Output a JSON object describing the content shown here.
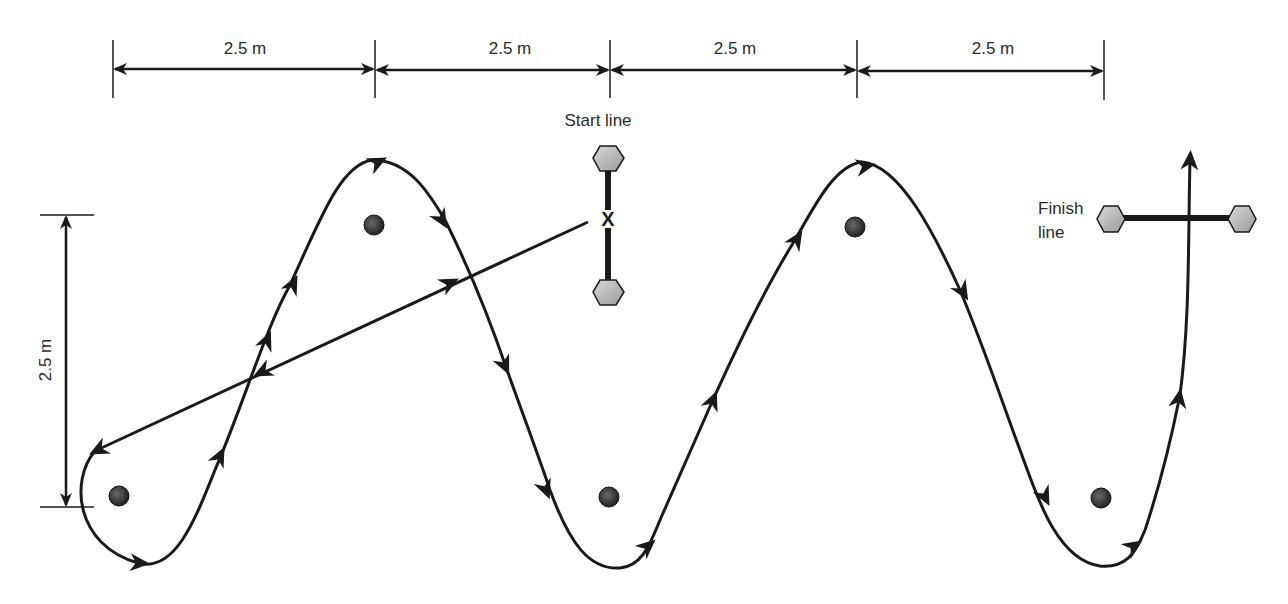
{
  "diagram": {
    "colors": {
      "stroke": "#1a1a1a",
      "cone_fill": "#3a3a3a",
      "post_fill": "#c0c0c0",
      "text": "#2a2a2a"
    },
    "dimensions": {
      "horizontal": [
        {
          "label": "2.5 m"
        },
        {
          "label": "2.5 m"
        },
        {
          "label": "2.5 m"
        },
        {
          "label": "2.5 m"
        }
      ],
      "vertical": {
        "label": "2.5 m"
      }
    },
    "start_line": {
      "label": "Start line",
      "marker": "X"
    },
    "finish_line": {
      "label_line1": "Finish",
      "label_line2": "line"
    },
    "cones": [
      {
        "name": "cone-1",
        "x": 119,
        "y": 496
      },
      {
        "name": "cone-2",
        "x": 374,
        "y": 225
      },
      {
        "name": "cone-3",
        "x": 609,
        "y": 497
      },
      {
        "name": "cone-4",
        "x": 855,
        "y": 227
      },
      {
        "name": "cone-5",
        "x": 1101,
        "y": 498
      }
    ]
  }
}
